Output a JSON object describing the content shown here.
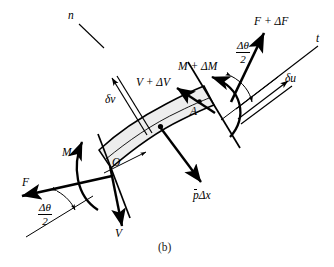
{
  "figure": {
    "caption": "(b)",
    "background_color": "#ffffff",
    "ink_color": "#000000",
    "element_fill_color": "#ededed"
  },
  "axes": {
    "normal_label": "n",
    "tangent_label": "t"
  },
  "left_face": {
    "axial_force_label": "F",
    "moment_label": "M",
    "shear_label": "V",
    "half_angle_numerator": "Δθ",
    "half_angle_denominator": "2"
  },
  "right_face": {
    "axial_force_label": "F + ΔF",
    "moment_label": "M + ΔM",
    "shear_label": "V + ΔV",
    "half_angle_numerator": "Δθ",
    "half_angle_denominator": "2"
  },
  "displacements": {
    "tangential_label": "δu",
    "normal_label": "δv"
  },
  "load": {
    "distributed_load_label_p": "p",
    "distributed_load_label_rest": "Δx"
  },
  "points": {
    "origin_label": "O",
    "section_label": "A"
  }
}
